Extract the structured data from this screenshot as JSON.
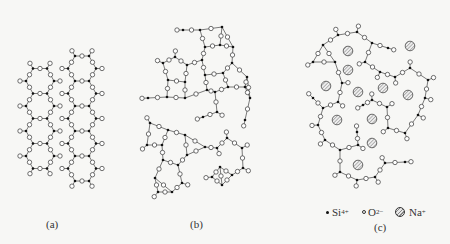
{
  "figure": {
    "panels": [
      {
        "id": "a",
        "label": "(a)",
        "description": "crystalline SiO2 hexagonal network"
      },
      {
        "id": "b",
        "label": "(b)",
        "description": "glassy SiO2 random network"
      },
      {
        "id": "c",
        "label": "(c)",
        "description": "sodium silicate glass network with Na+ ions"
      }
    ],
    "legend": {
      "si": {
        "symbol": "•",
        "text": "Si",
        "charge": "4+"
      },
      "o": {
        "symbol": "○",
        "text": "O",
        "charge": "2−"
      },
      "na": {
        "symbol": "hatched-circle",
        "text": "Na",
        "charge": "+"
      }
    },
    "colors": {
      "background": "#f7f7f5",
      "stroke": "#333333",
      "si": "#111111",
      "na_hatch": "#888888"
    }
  },
  "panel_a": {
    "origin_x": 40,
    "origin_y": 81,
    "cols": 2,
    "rows": 4,
    "hex_r": 14,
    "col_dx": 42,
    "row_dy": 25
  },
  "panel_b": {
    "si": [
      [
        183,
        30
      ],
      [
        200,
        30
      ],
      [
        222,
        27
      ],
      [
        205,
        47
      ],
      [
        220,
        45
      ],
      [
        233,
        47
      ],
      [
        175,
        57
      ],
      [
        202,
        60
      ],
      [
        232,
        63
      ],
      [
        187,
        65
      ],
      [
        163,
        63
      ],
      [
        223,
        73
      ],
      [
        168,
        80
      ],
      [
        185,
        82
      ],
      [
        205,
        75
      ],
      [
        247,
        77
      ],
      [
        207,
        90
      ],
      [
        228,
        87
      ],
      [
        245,
        87
      ],
      [
        148,
        98
      ],
      [
        167,
        97
      ],
      [
        185,
        98
      ],
      [
        215,
        92
      ],
      [
        250,
        98
      ],
      [
        203,
        117
      ],
      [
        217,
        112
      ],
      [
        245,
        120
      ],
      [
        150,
        123
      ],
      [
        168,
        130
      ],
      [
        185,
        135
      ],
      [
        205,
        147
      ],
      [
        217,
        148
      ],
      [
        227,
        138
      ],
      [
        242,
        148
      ],
      [
        147,
        145
      ],
      [
        162,
        145
      ],
      [
        187,
        155
      ],
      [
        163,
        160
      ],
      [
        178,
        165
      ],
      [
        220,
        167
      ],
      [
        243,
        168
      ],
      [
        155,
        178
      ],
      [
        182,
        183
      ],
      [
        212,
        177
      ],
      [
        232,
        175
      ],
      [
        158,
        192
      ],
      [
        172,
        192
      ],
      [
        222,
        185
      ]
    ]
  },
  "panel_c": {
    "si": [
      [
        338,
        35
      ],
      [
        357,
        32
      ],
      [
        323,
        45
      ],
      [
        372,
        43
      ],
      [
        388,
        48
      ],
      [
        313,
        62
      ],
      [
        335,
        62
      ],
      [
        365,
        62
      ],
      [
        380,
        72
      ],
      [
        395,
        77
      ],
      [
        410,
        68
      ],
      [
        428,
        80
      ],
      [
        342,
        83
      ],
      [
        313,
        98
      ],
      [
        338,
        102
      ],
      [
        372,
        100
      ],
      [
        425,
        98
      ],
      [
        323,
        108
      ],
      [
        363,
        105
      ],
      [
        387,
        107
      ],
      [
        418,
        115
      ],
      [
        318,
        125
      ],
      [
        357,
        132
      ],
      [
        388,
        128
      ],
      [
        405,
        133
      ],
      [
        325,
        140
      ],
      [
        340,
        150
      ],
      [
        358,
        145
      ],
      [
        385,
        163
      ],
      [
        405,
        162
      ],
      [
        340,
        172
      ],
      [
        357,
        180
      ],
      [
        375,
        177
      ]
    ],
    "na": [
      [
        348,
        51
      ],
      [
        410,
        46
      ],
      [
        348,
        70
      ],
      [
        326,
        86
      ],
      [
        358,
        92
      ],
      [
        383,
        88
      ],
      [
        408,
        95
      ],
      [
        337,
        120
      ],
      [
        372,
        119
      ],
      [
        372,
        143
      ],
      [
        358,
        165
      ]
    ]
  }
}
